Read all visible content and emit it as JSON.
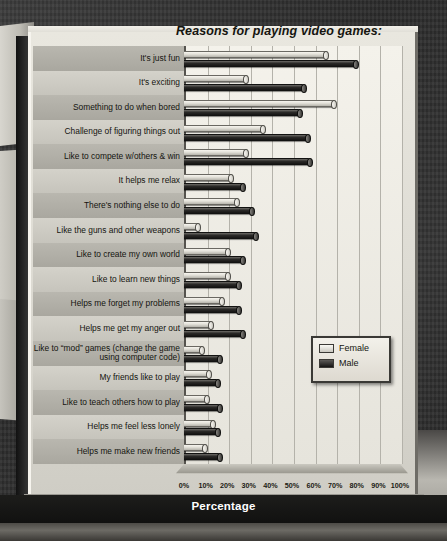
{
  "chart_data": {
    "type": "bar",
    "orientation": "horizontal",
    "title": "Reasons for playing video games:",
    "xlabel": "Percentage",
    "ylabel": "",
    "xlim": [
      0,
      100
    ],
    "xticks": [
      "0%",
      "10%",
      "20%",
      "30%",
      "40%",
      "50%",
      "60%",
      "70%",
      "80%",
      "90%",
      "100%"
    ],
    "grid": true,
    "legend_position": "middle-right",
    "categories": [
      "It's just fun",
      "It's exciting",
      "Something to do when bored",
      "Challenge of figuring things out",
      "Like to compete w/others & win",
      "It helps me relax",
      "There's nothing else to do",
      "Like the guns and other weapons",
      "Like to create my own world",
      "Like to learn new things",
      "Helps me forget my problems",
      "Helps me get my anger out",
      "Like to “mod” games (change the game using computer code)",
      "My friends like to play",
      "Like to teach others how to play",
      "Helps me feel less lonely",
      "Helps me make new friends"
    ],
    "series": [
      {
        "name": "Female",
        "color": "#e2e0d8",
        "values": [
          66,
          29,
          70,
          37,
          29,
          22,
          25,
          7,
          21,
          21,
          18,
          13,
          9,
          12,
          11,
          14,
          10
        ]
      },
      {
        "name": "Male",
        "color": "#1b1a18",
        "values": [
          80,
          56,
          54,
          58,
          59,
          28,
          32,
          34,
          28,
          26,
          26,
          28,
          17,
          16,
          17,
          16,
          17
        ]
      }
    ]
  },
  "legend": {
    "items": [
      {
        "label": "Female",
        "key": "female"
      },
      {
        "label": "Male",
        "key": "male"
      }
    ]
  },
  "axis": {
    "caption": "Percentage"
  },
  "colors": {
    "panel": "#e0ded6",
    "band_odd": "#b9b7af",
    "band_even": "#d4d2ca",
    "female": "#e2e0d8",
    "male": "#1b1a18",
    "background": "#2e2e2e"
  }
}
